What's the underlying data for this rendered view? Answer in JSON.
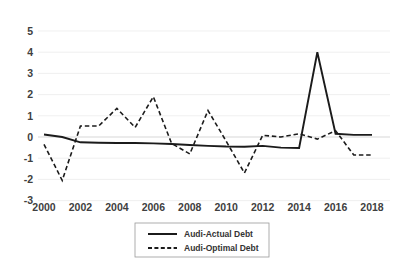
{
  "chart_data": {
    "type": "line",
    "title": "",
    "subtitle": "",
    "xlabel": "",
    "ylabel": "",
    "x": [
      2000,
      2001,
      2002,
      2003,
      2004,
      2005,
      2006,
      2007,
      2008,
      2009,
      2010,
      2011,
      2012,
      2013,
      2014,
      2015,
      2016,
      2017,
      2018
    ],
    "xlim": [
      2000,
      2018
    ],
    "ylim": [
      -3,
      5
    ],
    "yticks": [
      5,
      4,
      3,
      2,
      1,
      0,
      -1,
      -2,
      -3
    ],
    "ytick_labels": [
      "5",
      "4",
      "3",
      "2",
      "1",
      "0",
      "-1",
      "-2",
      "-3"
    ],
    "xticks": [
      2000,
      2002,
      2004,
      2006,
      2008,
      2010,
      2012,
      2014,
      2016,
      2018
    ],
    "xtick_labels": [
      "2000",
      "2002",
      "2004",
      "2006",
      "2008",
      "2010",
      "2012",
      "2014",
      "2016",
      "2018"
    ],
    "grid": true,
    "grid_axis": "y",
    "legend_position": "bottom-center",
    "series": [
      {
        "name": "Audi-Actual Debt",
        "style": "solid",
        "color": "#1b1b1b",
        "values": [
          0.12,
          0.0,
          -0.25,
          -0.27,
          -0.28,
          -0.28,
          -0.3,
          -0.33,
          -0.38,
          -0.42,
          -0.45,
          -0.46,
          -0.42,
          -0.5,
          -0.52,
          4.0,
          0.15,
          0.1,
          0.1
        ]
      },
      {
        "name": "Audi-Optimal Debt",
        "style": "dashed",
        "color": "#1b1b1b",
        "values": [
          -0.35,
          -2.05,
          0.52,
          0.52,
          1.35,
          0.45,
          1.9,
          -0.3,
          -0.8,
          1.25,
          -0.2,
          -1.7,
          0.08,
          0.0,
          0.15,
          -0.1,
          0.3,
          -0.85,
          -0.85
        ]
      }
    ]
  },
  "legend": {
    "items": [
      {
        "label": "Audi-Actual Debt",
        "style": "solid"
      },
      {
        "label": "Audi-Optimal Debt",
        "style": "dashed"
      }
    ]
  }
}
